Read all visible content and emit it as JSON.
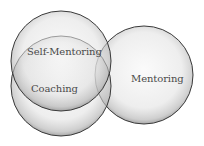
{
  "diagram": {
    "type": "venn",
    "circles": [
      {
        "id": "self-mentoring",
        "label": "Self-Mentoring",
        "cx": 61,
        "cy": 61,
        "r": 50
      },
      {
        "id": "coaching",
        "label": "Coaching",
        "cx": 61,
        "cy": 86,
        "r": 50
      },
      {
        "id": "mentoring",
        "label": "Mentoring",
        "cx": 144,
        "cy": 75,
        "r": 49
      }
    ],
    "colors": {
      "stroke": "#3a3a3a",
      "fill_center": "#f4f4f4",
      "fill_edge": "#9a9a9a",
      "text": "#4a4a4a"
    }
  },
  "labels": {
    "self_mentoring": "Self-Mentoring",
    "coaching": "Coaching",
    "mentoring": "Mentoring"
  }
}
